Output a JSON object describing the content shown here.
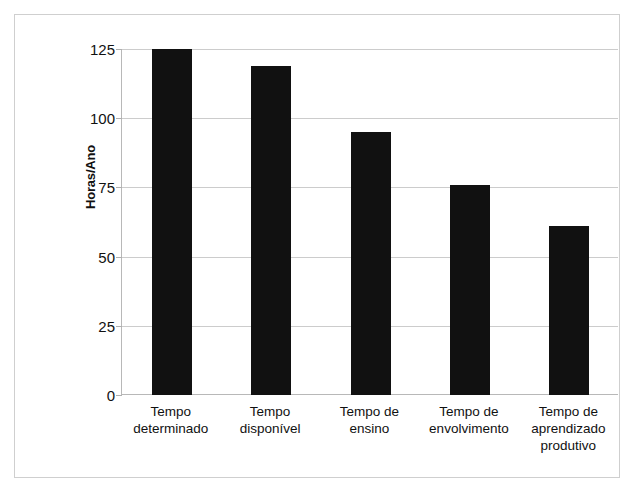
{
  "chart_data": {
    "type": "bar",
    "title": "",
    "xlabel": "",
    "ylabel": "Horas/Ano",
    "categories": [
      "Tempo determinado",
      "Tempo disponível",
      "Tempo de ensino",
      "Tempo de envolvimento",
      "Tempo de aprendizado produtivo"
    ],
    "category_lines": [
      [
        "Tempo",
        "determinado"
      ],
      [
        "Tempo",
        "disponível"
      ],
      [
        "Tempo de",
        "ensino"
      ],
      [
        "Tempo de",
        "envolvimento"
      ],
      [
        "Tempo de",
        "aprendizado",
        "produtivo"
      ]
    ],
    "values": [
      125,
      119,
      95,
      76,
      61
    ],
    "ylim": [
      0,
      125
    ],
    "yticks": [
      0,
      25,
      50,
      75,
      100,
      125
    ],
    "ytick_labels": [
      "0",
      "25",
      "50",
      "75",
      "100",
      "125"
    ],
    "grid": true,
    "legend": false,
    "bar_color": "#111111",
    "gridline_color": "#cccccc",
    "axis_color": "#b8b8b8",
    "frame_color": "#cfcfcf",
    "background": "#ffffff"
  }
}
